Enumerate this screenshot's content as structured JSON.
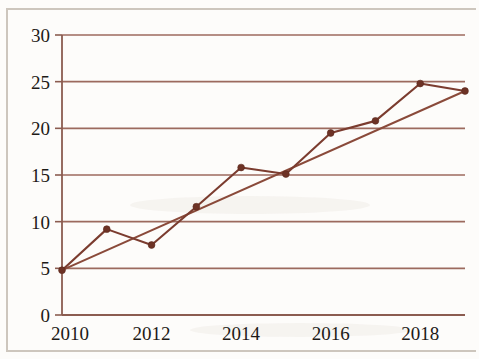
{
  "chart_data": {
    "type": "line",
    "title": "",
    "subtitle": "",
    "xlabel": "",
    "ylabel": "",
    "x": [
      2010,
      2011,
      2012,
      2013,
      2014,
      2015,
      2016,
      2017,
      2018,
      2019
    ],
    "xlim": [
      2010,
      2019
    ],
    "ylim": [
      0,
      30
    ],
    "grid": true,
    "grid_axis": "y",
    "legend": "none",
    "x_tick_labels": [
      "2010",
      "2012",
      "2014",
      "2016",
      "2018"
    ],
    "x_tick_values": [
      2010,
      2012,
      2014,
      2016,
      2018
    ],
    "y_tick_labels": [
      "0",
      "5",
      "10",
      "15",
      "20",
      "25",
      "30"
    ],
    "y_tick_values": [
      0,
      5,
      10,
      15,
      20,
      25,
      30
    ],
    "series": [
      {
        "name": "data",
        "kind": "line-with-markers",
        "color": "#7b3c2f",
        "values": [
          4.8,
          9.2,
          7.5,
          11.6,
          15.8,
          15.1,
          19.5,
          20.8,
          24.8,
          24.0
        ]
      },
      {
        "name": "trendline",
        "kind": "line",
        "color": "#8a4a3a",
        "x": [
          2010,
          2019
        ],
        "values": [
          4.8,
          24.0
        ]
      }
    ],
    "colors": {
      "gridline": "#9c6a5e",
      "axis": "#8b5c50",
      "series": "#7b3c2f",
      "trendline": "#8a4a3a",
      "marker": "#6d3225",
      "background": "#fdfcfa",
      "tick_text": "#1d1a17",
      "page_border": "#cdc6bd"
    }
  }
}
